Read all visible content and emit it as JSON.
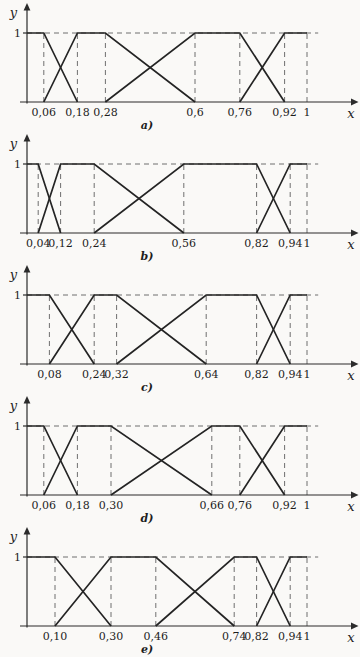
{
  "figure": {
    "description_colors": {
      "line": "#242424",
      "dash": "#6f6f6f",
      "background": "#faf9f7"
    }
  },
  "chart_data": [
    {
      "type": "line",
      "label": "a)",
      "xlabel": "x",
      "ylabel": "y",
      "xlim": [
        0,
        1.16
      ],
      "ylim": [
        0,
        1
      ],
      "grid": "dashed-guides",
      "legend": "none",
      "y_ticks": [
        {
          "value": 1,
          "label": "1"
        }
      ],
      "x_ticks": [
        {
          "value": 0.06,
          "label": "0,06"
        },
        {
          "value": 0.18,
          "label": "0,18"
        },
        {
          "value": 0.28,
          "label": "0,28"
        },
        {
          "value": 0.6,
          "label": "0,6"
        },
        {
          "value": 0.76,
          "label": "0,76"
        },
        {
          "value": 0.92,
          "label": "0,92"
        },
        {
          "value": 1,
          "label": "1"
        }
      ],
      "dashed_vertical_x": [
        0.06,
        0.18,
        0.28,
        0.6,
        0.76,
        0.92,
        1
      ],
      "dashed_horizontal": {
        "y": 1,
        "x_start": 0,
        "x_end": 1.04
      },
      "series": [
        {
          "name": "mf1",
          "points": [
            [
              0,
              1
            ],
            [
              0.06,
              1
            ],
            [
              0.18,
              0
            ]
          ]
        },
        {
          "name": "mf2",
          "points": [
            [
              0.06,
              0
            ],
            [
              0.18,
              1
            ],
            [
              0.28,
              1
            ],
            [
              0.6,
              0
            ]
          ]
        },
        {
          "name": "mf3",
          "points": [
            [
              0.28,
              0
            ],
            [
              0.6,
              1
            ],
            [
              0.76,
              1
            ],
            [
              0.92,
              0
            ]
          ]
        },
        {
          "name": "mf4",
          "points": [
            [
              0.76,
              0
            ],
            [
              0.92,
              1
            ],
            [
              1,
              1
            ]
          ]
        }
      ]
    },
    {
      "type": "line",
      "label": "b)",
      "xlabel": "x",
      "ylabel": "y",
      "xlim": [
        0,
        1.16
      ],
      "ylim": [
        0,
        1
      ],
      "grid": "dashed-guides",
      "legend": "none",
      "y_ticks": [
        {
          "value": 1,
          "label": "1"
        }
      ],
      "x_ticks": [
        {
          "value": 0.04,
          "label": "0,04"
        },
        {
          "value": 0.12,
          "label": "0,12"
        },
        {
          "value": 0.24,
          "label": "0,24"
        },
        {
          "value": 0.56,
          "label": "0,56"
        },
        {
          "value": 0.82,
          "label": "0,82"
        },
        {
          "value": 0.94,
          "label": "0,94"
        },
        {
          "value": 1,
          "label": "1"
        }
      ],
      "dashed_vertical_x": [
        0.04,
        0.12,
        0.24,
        0.56,
        0.82,
        0.94,
        1
      ],
      "dashed_horizontal": {
        "y": 1,
        "x_start": 0,
        "x_end": 1.04
      },
      "series": [
        {
          "name": "mf1",
          "points": [
            [
              0,
              1
            ],
            [
              0.04,
              1
            ],
            [
              0.12,
              0
            ]
          ]
        },
        {
          "name": "mf2",
          "points": [
            [
              0.04,
              0
            ],
            [
              0.12,
              1
            ],
            [
              0.24,
              1
            ],
            [
              0.56,
              0
            ]
          ]
        },
        {
          "name": "mf3",
          "points": [
            [
              0.24,
              0
            ],
            [
              0.56,
              1
            ],
            [
              0.82,
              1
            ],
            [
              0.94,
              0
            ]
          ]
        },
        {
          "name": "mf4",
          "points": [
            [
              0.82,
              0
            ],
            [
              0.94,
              1
            ],
            [
              1,
              1
            ]
          ]
        }
      ]
    },
    {
      "type": "line",
      "label": "c)",
      "xlabel": "x",
      "ylabel": "y",
      "xlim": [
        0,
        1.16
      ],
      "ylim": [
        0,
        1
      ],
      "grid": "dashed-guides",
      "legend": "none",
      "y_ticks": [
        {
          "value": 1,
          "label": "1"
        }
      ],
      "x_ticks": [
        {
          "value": 0.08,
          "label": "0,08"
        },
        {
          "value": 0.24,
          "label": "0,24"
        },
        {
          "value": 0.32,
          "label": "0,32"
        },
        {
          "value": 0.64,
          "label": "0,64"
        },
        {
          "value": 0.82,
          "label": "0,82"
        },
        {
          "value": 0.94,
          "label": "0,94"
        },
        {
          "value": 1,
          "label": "1"
        }
      ],
      "dashed_vertical_x": [
        0.08,
        0.24,
        0.32,
        0.64,
        0.82,
        0.94,
        1
      ],
      "dashed_horizontal": {
        "y": 1,
        "x_start": 0,
        "x_end": 1.04
      },
      "series": [
        {
          "name": "mf1",
          "points": [
            [
              0,
              1
            ],
            [
              0.08,
              1
            ],
            [
              0.24,
              0
            ]
          ]
        },
        {
          "name": "mf2",
          "points": [
            [
              0.08,
              0
            ],
            [
              0.24,
              1
            ],
            [
              0.32,
              1
            ],
            [
              0.64,
              0
            ]
          ]
        },
        {
          "name": "mf3",
          "points": [
            [
              0.32,
              0
            ],
            [
              0.64,
              1
            ],
            [
              0.82,
              1
            ],
            [
              0.94,
              0
            ]
          ]
        },
        {
          "name": "mf4",
          "points": [
            [
              0.82,
              0
            ],
            [
              0.94,
              1
            ],
            [
              1,
              1
            ]
          ]
        }
      ]
    },
    {
      "type": "line",
      "label": "d)",
      "xlabel": "x",
      "ylabel": "y",
      "xlim": [
        0,
        1.16
      ],
      "ylim": [
        0,
        1
      ],
      "grid": "dashed-guides",
      "legend": "none",
      "y_ticks": [
        {
          "value": 1,
          "label": "1"
        }
      ],
      "x_ticks": [
        {
          "value": 0.06,
          "label": "0,06"
        },
        {
          "value": 0.18,
          "label": "0,18"
        },
        {
          "value": 0.3,
          "label": "0,30"
        },
        {
          "value": 0.66,
          "label": "0,66"
        },
        {
          "value": 0.76,
          "label": "0,76"
        },
        {
          "value": 0.92,
          "label": "0,92"
        },
        {
          "value": 1,
          "label": "1"
        }
      ],
      "dashed_vertical_x": [
        0.06,
        0.18,
        0.3,
        0.66,
        0.76,
        0.92,
        1
      ],
      "dashed_horizontal": {
        "y": 1,
        "x_start": 0,
        "x_end": 1.04
      },
      "series": [
        {
          "name": "mf1",
          "points": [
            [
              0,
              1
            ],
            [
              0.06,
              1
            ],
            [
              0.18,
              0
            ]
          ]
        },
        {
          "name": "mf2",
          "points": [
            [
              0.06,
              0
            ],
            [
              0.18,
              1
            ],
            [
              0.3,
              1
            ],
            [
              0.66,
              0
            ]
          ]
        },
        {
          "name": "mf3",
          "points": [
            [
              0.3,
              0
            ],
            [
              0.66,
              1
            ],
            [
              0.76,
              1
            ],
            [
              0.92,
              0
            ]
          ]
        },
        {
          "name": "mf4",
          "points": [
            [
              0.76,
              0
            ],
            [
              0.92,
              1
            ],
            [
              1,
              1
            ]
          ]
        }
      ]
    },
    {
      "type": "line",
      "label": "e)",
      "xlabel": "x",
      "ylabel": "y",
      "xlim": [
        0,
        1.16
      ],
      "ylim": [
        0,
        1
      ],
      "grid": "dashed-guides",
      "legend": "none",
      "y_ticks": [
        {
          "value": 1,
          "label": "1"
        }
      ],
      "x_ticks": [
        {
          "value": 0.1,
          "label": "0,10"
        },
        {
          "value": 0.3,
          "label": "0,30"
        },
        {
          "value": 0.46,
          "label": "0,46"
        },
        {
          "value": 0.74,
          "label": "0,74"
        },
        {
          "value": 0.82,
          "label": "0,82"
        },
        {
          "value": 0.94,
          "label": "0,94"
        },
        {
          "value": 1,
          "label": "1"
        }
      ],
      "dashed_vertical_x": [
        0.1,
        0.3,
        0.46,
        0.74,
        0.82,
        0.94,
        1
      ],
      "dashed_horizontal": {
        "y": 1,
        "x_start": 0,
        "x_end": 1.04
      },
      "series": [
        {
          "name": "mf1",
          "points": [
            [
              0,
              1
            ],
            [
              0.1,
              1
            ],
            [
              0.3,
              0
            ]
          ]
        },
        {
          "name": "mf2",
          "points": [
            [
              0.1,
              0
            ],
            [
              0.3,
              1
            ],
            [
              0.46,
              1
            ],
            [
              0.74,
              0
            ]
          ]
        },
        {
          "name": "mf3",
          "points": [
            [
              0.46,
              0
            ],
            [
              0.74,
              1
            ],
            [
              0.82,
              1
            ],
            [
              0.94,
              0
            ]
          ]
        },
        {
          "name": "mf4",
          "points": [
            [
              0.82,
              0
            ],
            [
              0.94,
              1
            ],
            [
              1,
              1
            ]
          ]
        }
      ]
    }
  ]
}
